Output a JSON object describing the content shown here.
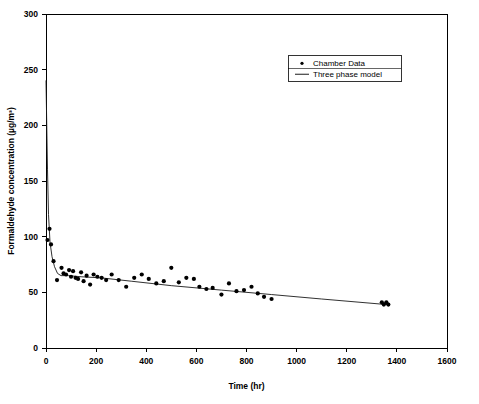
{
  "chart_data": {
    "type": "scatter",
    "title": "",
    "xlabel": "Time (hr)",
    "ylabel": "Formaldehyde concentration (µg/m³)",
    "xlim": [
      0,
      1600
    ],
    "ylim": [
      0,
      300
    ],
    "xticks": [
      0,
      200,
      400,
      600,
      800,
      1000,
      1200,
      1400,
      1600
    ],
    "yticks": [
      0,
      50,
      100,
      150,
      200,
      250,
      300
    ],
    "xtick_labels": [
      "0",
      "200",
      "400",
      "600",
      "800",
      "1000",
      "1200",
      "1400",
      "1600"
    ],
    "ytick_labels": [
      "0",
      "50",
      "100",
      "150",
      "200",
      "250",
      "300"
    ],
    "grid": false,
    "legend_position": "top-right",
    "legend": [
      {
        "label": "Chamber Data",
        "marker": "dot",
        "color": "#000000"
      },
      {
        "label": "Three phase model",
        "marker": "line",
        "color": "#000000"
      }
    ],
    "series": [
      {
        "name": "Chamber Data",
        "type": "scatter",
        "marker": "dot",
        "color": "#000000",
        "points": [
          [
            6,
            97
          ],
          [
            14,
            107
          ],
          [
            20,
            93
          ],
          [
            30,
            78
          ],
          [
            44,
            61
          ],
          [
            62,
            72
          ],
          [
            70,
            67
          ],
          [
            80,
            66
          ],
          [
            92,
            70
          ],
          [
            100,
            64
          ],
          [
            108,
            69
          ],
          [
            118,
            63
          ],
          [
            128,
            62
          ],
          [
            140,
            68
          ],
          [
            150,
            60
          ],
          [
            162,
            65
          ],
          [
            176,
            57
          ],
          [
            190,
            66
          ],
          [
            205,
            64
          ],
          [
            222,
            63
          ],
          [
            240,
            61
          ],
          [
            262,
            66
          ],
          [
            290,
            61
          ],
          [
            320,
            55
          ],
          [
            352,
            63
          ],
          [
            382,
            66
          ],
          [
            410,
            62
          ],
          [
            440,
            58
          ],
          [
            470,
            60
          ],
          [
            500,
            72
          ],
          [
            530,
            59
          ],
          [
            560,
            63
          ],
          [
            590,
            62
          ],
          [
            612,
            55
          ],
          [
            640,
            53
          ],
          [
            665,
            54
          ],
          [
            700,
            48
          ],
          [
            730,
            58
          ],
          [
            760,
            51
          ],
          [
            790,
            52
          ],
          [
            820,
            55
          ],
          [
            845,
            49
          ],
          [
            870,
            46
          ],
          [
            900,
            44
          ],
          [
            1340,
            41
          ],
          [
            1348,
            39
          ],
          [
            1358,
            41
          ],
          [
            1366,
            39
          ]
        ]
      },
      {
        "name": "Three phase model",
        "type": "line",
        "color": "#000000",
        "points": [
          [
            0,
            240
          ],
          [
            3,
            200
          ],
          [
            6,
            160
          ],
          [
            10,
            120
          ],
          [
            16,
            95
          ],
          [
            24,
            82
          ],
          [
            34,
            73
          ],
          [
            46,
            67
          ],
          [
            60,
            65
          ],
          [
            90,
            65
          ],
          [
            140,
            64
          ],
          [
            220,
            63
          ],
          [
            340,
            60
          ],
          [
            500,
            56
          ],
          [
            700,
            52
          ],
          [
            900,
            48
          ],
          [
            1100,
            44
          ],
          [
            1360,
            39
          ]
        ]
      }
    ]
  },
  "axes_geometry": {
    "left_px": 46,
    "right_px": 447,
    "top_px": 14,
    "bottom_px": 348
  },
  "legend_geometry": {
    "x_px": 288,
    "y_px": 55,
    "width_px": 113,
    "height_px": 26
  }
}
